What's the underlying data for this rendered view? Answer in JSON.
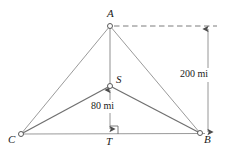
{
  "figure": {
    "type": "geometry-diagram",
    "background_color": "#ffffff",
    "line_color": "#8a8a8a",
    "dark_line_color": "#6e6e6e",
    "text_color": "#1a1a1a",
    "width": 232,
    "height": 154
  },
  "vertices": [
    {
      "id": "A",
      "label": "A",
      "x": 110,
      "y": 26,
      "label_x": 107,
      "label_y": 8
    },
    {
      "id": "S",
      "label": "S",
      "x": 110,
      "y": 86,
      "label_x": 116,
      "label_y": 74
    },
    {
      "id": "C",
      "label": "C",
      "x": 21,
      "y": 134,
      "label_x": 8,
      "label_y": 134
    },
    {
      "id": "B",
      "label": "B",
      "x": 200,
      "y": 133,
      "label_x": 204,
      "label_y": 134
    },
    {
      "id": "T",
      "label": "T",
      "x": 110,
      "y": 134,
      "label_x": 106,
      "label_y": 136
    }
  ],
  "dimensions": [
    {
      "id": "vertical-200",
      "label": "200 mi",
      "value": 200,
      "unit": "mi",
      "from_y": 27,
      "to_y": 134,
      "line_x": 208,
      "label_x": 180,
      "label_y": 69
    },
    {
      "id": "vertical-80",
      "label": "80 mi",
      "value": 80,
      "unit": "mi",
      "from_y": 134,
      "to_y": 90,
      "line_x": 110,
      "label_x": 91,
      "label_y": 101
    }
  ],
  "markers": {
    "right_angle_at": "T",
    "dashed_guide": {
      "from_x": 113,
      "to_x": 217,
      "y": 26
    }
  }
}
